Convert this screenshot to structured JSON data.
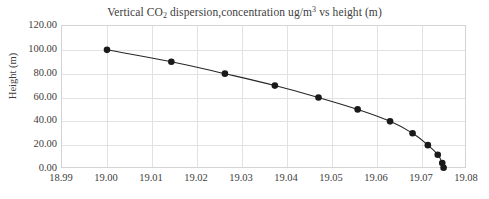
{
  "chart_data": {
    "type": "line",
    "title": "Vertical CO2 dispersion,concentration ug/m3 vs height (m)",
    "title_parts": {
      "before_sub": "Vertical CO",
      "sub": "2",
      "middle": " dispersion,concentration ug/m",
      "sup": "3",
      "after_sup": " vs height (m)"
    },
    "xlabel": "",
    "ylabel": "Height (m)",
    "xlim": [
      18.99,
      19.08
    ],
    "ylim": [
      0.0,
      120.0
    ],
    "x_ticks": [
      18.99,
      19.0,
      19.01,
      19.02,
      19.03,
      19.04,
      19.05,
      19.06,
      19.07,
      19.08
    ],
    "x_tick_labels": [
      "18.99",
      "19.00",
      "19.01",
      "19.02",
      "19.03",
      "19.04",
      "19.05",
      "19.06",
      "19.07",
      "19.08"
    ],
    "y_ticks": [
      0.0,
      20.0,
      40.0,
      60.0,
      80.0,
      100.0,
      120.0
    ],
    "y_tick_labels": [
      "0.00",
      "20.00",
      "40.00",
      "60.00",
      "80.00",
      "100.00",
      "120.00"
    ],
    "grid": true,
    "grid_axes": "both",
    "legend": false,
    "legend_position": "none",
    "marker": "filled-circle",
    "marker_color": "#1a1a1a",
    "line_color": "#262626",
    "series": [
      {
        "name": "CO2 concentration vs height",
        "x": [
          19.0,
          19.0143,
          19.0262,
          19.0373,
          19.047,
          19.0557,
          19.0629,
          19.0679,
          19.0713,
          19.0735,
          19.0745,
          19.0748
        ],
        "y": [
          100.0,
          90.0,
          80.0,
          70.0,
          60.0,
          50.0,
          40.0,
          30.0,
          20.0,
          12.0,
          5.0,
          1.0
        ]
      }
    ]
  },
  "colors": {
    "background": "#ffffff",
    "text": "#3d3d3d",
    "grid": "#e2e2e2",
    "frame": "#d4d4d4",
    "series": "#1a1a1a"
  }
}
